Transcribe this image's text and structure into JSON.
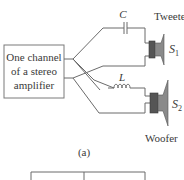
{
  "figure": {
    "caption": "(a)",
    "amplifier": {
      "lines": [
        "One channel",
        "of a stereo",
        "amplifier"
      ]
    },
    "capacitor": {
      "symbol": "C"
    },
    "inductor": {
      "symbol": "L"
    },
    "speakers": [
      {
        "name": "Tweeter",
        "symbol": "S",
        "subscript": "1"
      },
      {
        "name": "Woofer",
        "symbol": "S",
        "subscript": "2"
      }
    ]
  }
}
